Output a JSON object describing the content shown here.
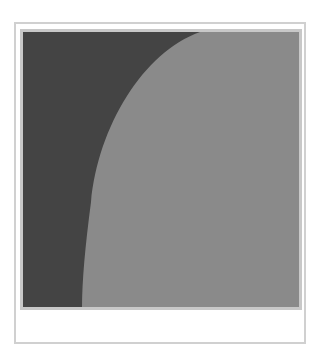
{
  "image": {
    "description": "abstract two-tone gray artwork with curved boundary",
    "colors": {
      "dark_region": "#444444",
      "light_region": "#8a8a8a",
      "card_border": "#d0d0d0",
      "frame_border": "#c8c8c8"
    }
  },
  "caption": {
    "text": ""
  }
}
